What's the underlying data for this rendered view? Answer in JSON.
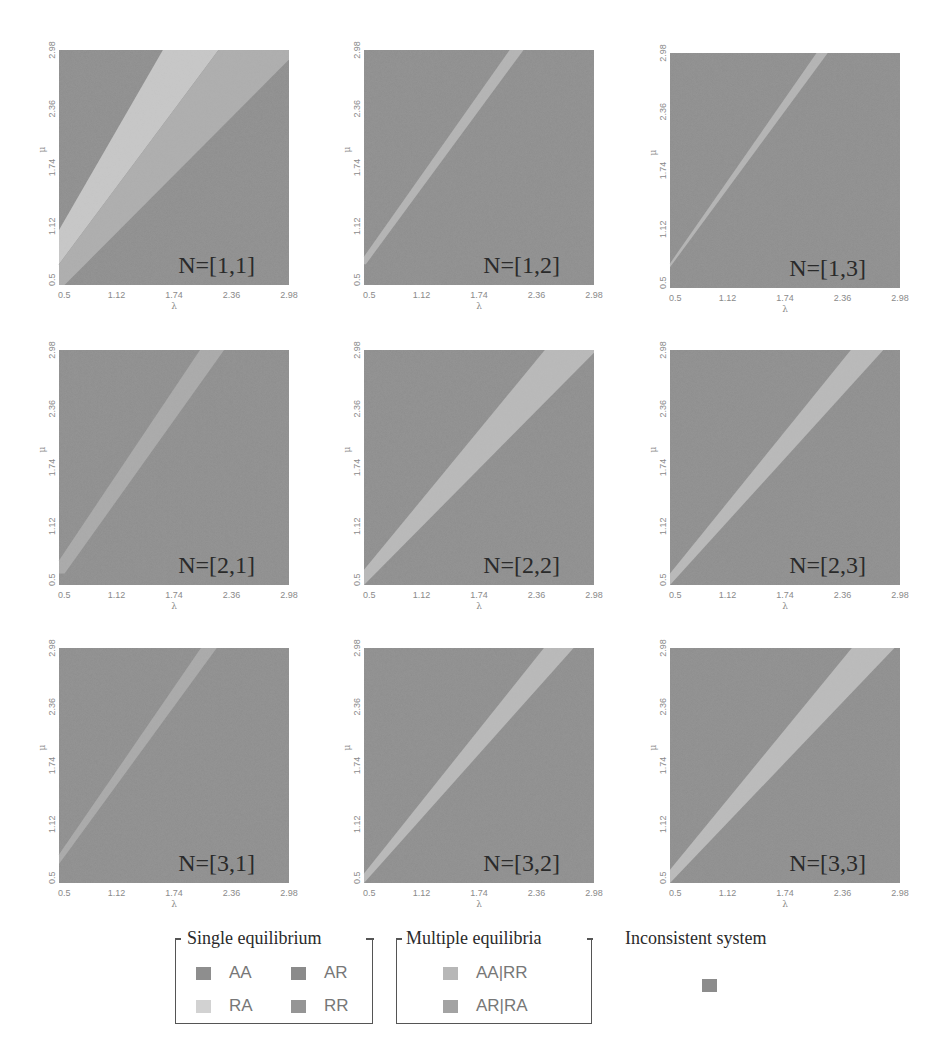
{
  "figure": {
    "colors": {
      "AA": "#8e8e8e",
      "AR": "#8a8a8a",
      "RA": "#cfcfcf",
      "RR": "#8f8f8f",
      "AA|RR": "#b4b4b4",
      "AR|RA": "#a6a6a6",
      "inconsistent": "#8c8c8c",
      "background_dark": "#8d8d8d",
      "band_light": "#b9b9b9"
    }
  },
  "legend": {
    "single": {
      "title": "Single equilibrium",
      "items": [
        {
          "label": "AA",
          "color": "#8e8e8e"
        },
        {
          "label": "AR",
          "color": "#8b8b8b"
        },
        {
          "label": "RA",
          "color": "#d2d2d2"
        },
        {
          "label": "RR",
          "color": "#959595"
        }
      ]
    },
    "multiple": {
      "title": "Multiple  equilibria",
      "items": [
        {
          "label": "AA|RR",
          "color": "#b7b7b7"
        },
        {
          "label": "AR|RA",
          "color": "#a3a3a3"
        }
      ]
    },
    "inconsistent": {
      "title": "Inconsistent system",
      "color": "#8c8c8c"
    }
  },
  "chart_data": [
    {
      "type": "heatmap",
      "title": "N=[1,1]",
      "xlabel": "λ",
      "ylabel": "μ",
      "xlim": [
        0.5,
        2.98
      ],
      "ylim": [
        0.5,
        2.98
      ],
      "xticks": [
        "0.5",
        "1.12",
        "1.74",
        "2.36",
        "2.98"
      ],
      "yticks": [
        "0.5",
        "1.12",
        "1.74",
        "2.36",
        "2.98"
      ],
      "regions": [
        {
          "class": "RA",
          "color": "#c8c8c8",
          "polygon": [
            [
              0.5,
              1.08
            ],
            [
              1.62,
              2.98
            ],
            [
              2.22,
              2.98
            ],
            [
              0.5,
              0.72
            ]
          ]
        },
        {
          "class": "AA|RR",
          "color": "#adadad",
          "polygon": [
            [
              0.5,
              0.72
            ],
            [
              2.22,
              2.98
            ],
            [
              2.98,
              2.98
            ],
            [
              2.98,
              2.88
            ],
            [
              0.56,
              0.5
            ],
            [
              0.5,
              0.5
            ]
          ]
        }
      ]
    },
    {
      "type": "heatmap",
      "title": "N=[1,2]",
      "xlabel": "λ",
      "ylabel": "μ",
      "xlim": [
        0.5,
        2.98
      ],
      "ylim": [
        0.5,
        2.98
      ],
      "xticks": [
        "0.5",
        "1.12",
        "1.74",
        "2.36",
        "2.98"
      ],
      "yticks": [
        "0.5",
        "1.12",
        "1.74",
        "2.36",
        "2.98"
      ],
      "regions": [
        {
          "class": "AA|RR",
          "color": "#b4b4b4",
          "polygon": [
            [
              0.5,
              0.8
            ],
            [
              2.07,
              2.98
            ],
            [
              2.22,
              2.98
            ],
            [
              0.52,
              0.72
            ],
            [
              0.5,
              0.72
            ]
          ]
        }
      ]
    },
    {
      "type": "heatmap",
      "title": "N=[1,3]",
      "xlabel": "λ",
      "ylabel": "μ",
      "xlim": [
        0.5,
        2.98
      ],
      "ylim": [
        0.5,
        2.98
      ],
      "xticks": [
        "0.5",
        "1.12",
        "1.74",
        "2.36",
        "2.98"
      ],
      "yticks": [
        "0.5",
        "1.12",
        "1.74",
        "2.36",
        "2.98"
      ],
      "regions": [
        {
          "class": "AA|RR",
          "color": "#b4b4b4",
          "polygon": [
            [
              0.5,
              0.76
            ],
            [
              2.08,
              2.98
            ],
            [
              2.2,
              2.98
            ],
            [
              0.5,
              0.72
            ]
          ]
        }
      ]
    },
    {
      "type": "heatmap",
      "title": "N=[2,1]",
      "xlabel": "λ",
      "ylabel": "μ",
      "xlim": [
        0.5,
        2.98
      ],
      "ylim": [
        0.5,
        2.98
      ],
      "xticks": [
        "0.5",
        "1.12",
        "1.74",
        "2.36",
        "2.98"
      ],
      "yticks": [
        "0.5",
        "1.12",
        "1.74",
        "2.36",
        "2.98"
      ],
      "regions": [
        {
          "class": "AA|RR",
          "color": "#a9a9a9",
          "polygon": [
            [
              0.5,
              0.76
            ],
            [
              2.02,
              2.98
            ],
            [
              2.28,
              2.98
            ],
            [
              0.56,
              0.62
            ],
            [
              0.5,
              0.62
            ]
          ]
        }
      ]
    },
    {
      "type": "heatmap",
      "title": "N=[2,2]",
      "xlabel": "λ",
      "ylabel": "μ",
      "xlim": [
        0.5,
        2.98
      ],
      "ylim": [
        0.5,
        2.98
      ],
      "xticks": [
        "0.5",
        "1.12",
        "1.74",
        "2.36",
        "2.98"
      ],
      "yticks": [
        "0.5",
        "1.12",
        "1.74",
        "2.36",
        "2.98"
      ],
      "regions": [
        {
          "class": "AA|RR",
          "color": "#b9b9b9",
          "polygon": [
            [
              0.5,
              0.66
            ],
            [
              2.45,
              2.98
            ],
            [
              2.98,
              2.98
            ],
            [
              2.98,
              2.95
            ],
            [
              0.5,
              0.5
            ]
          ]
        }
      ]
    },
    {
      "type": "heatmap",
      "title": "N=[2,3]",
      "xlabel": "λ",
      "ylabel": "μ",
      "xlim": [
        0.5,
        2.98
      ],
      "ylim": [
        0.5,
        2.98
      ],
      "xticks": [
        "0.5",
        "1.12",
        "1.74",
        "2.36",
        "2.98"
      ],
      "yticks": [
        "0.5",
        "1.12",
        "1.74",
        "2.36",
        "2.98"
      ],
      "regions": [
        {
          "class": "AA|RR",
          "color": "#b9b9b9",
          "polygon": [
            [
              0.5,
              0.62
            ],
            [
              2.45,
              2.98
            ],
            [
              2.8,
              2.98
            ],
            [
              0.5,
              0.5
            ]
          ]
        }
      ]
    },
    {
      "type": "heatmap",
      "title": "N=[3,1]",
      "xlabel": "λ",
      "ylabel": "μ",
      "xlim": [
        0.5,
        2.98
      ],
      "ylim": [
        0.5,
        2.98
      ],
      "xticks": [
        "0.5",
        "1.12",
        "1.74",
        "2.36",
        "2.98"
      ],
      "yticks": [
        "0.5",
        "1.12",
        "1.74",
        "2.36",
        "2.98"
      ],
      "regions": [
        {
          "class": "AA|RR",
          "color": "#a9a9a9",
          "polygon": [
            [
              0.5,
              0.8
            ],
            [
              2.03,
              2.98
            ],
            [
              2.2,
              2.98
            ],
            [
              0.5,
              0.7
            ]
          ]
        }
      ]
    },
    {
      "type": "heatmap",
      "title": "N=[3,2]",
      "xlabel": "λ",
      "ylabel": "μ",
      "xlim": [
        0.5,
        2.98
      ],
      "ylim": [
        0.5,
        2.98
      ],
      "xticks": [
        "0.5",
        "1.12",
        "1.74",
        "2.36",
        "2.98"
      ],
      "yticks": [
        "0.5",
        "1.12",
        "1.74",
        "2.36",
        "2.98"
      ],
      "regions": [
        {
          "class": "AA|RR",
          "color": "#b9b9b9",
          "polygon": [
            [
              0.5,
              0.6
            ],
            [
              2.44,
              2.98
            ],
            [
              2.76,
              2.98
            ],
            [
              0.5,
              0.5
            ]
          ]
        }
      ]
    },
    {
      "type": "heatmap",
      "title": "N=[3,3]",
      "xlabel": "λ",
      "ylabel": "μ",
      "xlim": [
        0.5,
        2.98
      ],
      "ylim": [
        0.5,
        2.98
      ],
      "xticks": [
        "0.5",
        "1.12",
        "1.74",
        "2.36",
        "2.98"
      ],
      "yticks": [
        "0.5",
        "1.12",
        "1.74",
        "2.36",
        "2.98"
      ],
      "regions": [
        {
          "class": "AA|RR",
          "color": "#bbbbbb",
          "polygon": [
            [
              0.5,
              0.64
            ],
            [
              2.46,
              2.98
            ],
            [
              2.92,
              2.98
            ],
            [
              0.5,
              0.5
            ]
          ]
        }
      ]
    }
  ]
}
